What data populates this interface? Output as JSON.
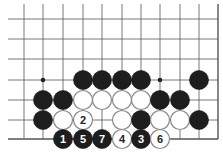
{
  "board": {
    "grid_x": [
      24,
      43,
      63,
      83,
      102,
      122,
      141,
      160,
      180,
      199,
      218
    ],
    "grid_y": [
      19,
      39,
      59,
      80,
      100,
      120,
      139
    ],
    "line_left": 8,
    "line_top": 4,
    "right_edge_col": 10,
    "bottom_edge_row": 6,
    "line_color": "#555555",
    "stone_radius": 9.5,
    "colors": {
      "black": "#1e1e1e",
      "white": "#ffffff",
      "white_border": "#888888"
    },
    "star_points": [
      {
        "col": 1,
        "row": 3
      },
      {
        "col": 7,
        "row": 3
      }
    ],
    "stones": [
      {
        "col": 3,
        "row": 3,
        "color": "black",
        "label": ""
      },
      {
        "col": 4,
        "row": 3,
        "color": "black",
        "label": ""
      },
      {
        "col": 5,
        "row": 3,
        "color": "black",
        "label": ""
      },
      {
        "col": 6,
        "row": 3,
        "color": "black",
        "label": ""
      },
      {
        "col": 9,
        "row": 3,
        "color": "black",
        "label": ""
      },
      {
        "col": 1,
        "row": 4,
        "color": "black",
        "label": ""
      },
      {
        "col": 2,
        "row": 4,
        "color": "black",
        "label": ""
      },
      {
        "col": 3,
        "row": 4,
        "color": "white",
        "label": ""
      },
      {
        "col": 4,
        "row": 4,
        "color": "white",
        "label": ""
      },
      {
        "col": 5,
        "row": 4,
        "color": "white",
        "label": ""
      },
      {
        "col": 6,
        "row": 4,
        "color": "white",
        "label": ""
      },
      {
        "col": 7,
        "row": 4,
        "color": "black",
        "label": ""
      },
      {
        "col": 8,
        "row": 4,
        "color": "black",
        "label": ""
      },
      {
        "col": 1,
        "row": 5,
        "color": "black",
        "label": ""
      },
      {
        "col": 2,
        "row": 5,
        "color": "white",
        "label": ""
      },
      {
        "col": 3,
        "row": 5,
        "color": "white",
        "label": "2"
      },
      {
        "col": 5,
        "row": 5,
        "color": "white",
        "label": ""
      },
      {
        "col": 6,
        "row": 5,
        "color": "black",
        "label": ""
      },
      {
        "col": 7,
        "row": 5,
        "color": "white",
        "label": ""
      },
      {
        "col": 8,
        "row": 5,
        "color": "white",
        "label": ""
      },
      {
        "col": 9,
        "row": 5,
        "color": "black",
        "label": ""
      },
      {
        "col": 2,
        "row": 6,
        "color": "black",
        "label": "1"
      },
      {
        "col": 3,
        "row": 6,
        "color": "black",
        "label": "5"
      },
      {
        "col": 4,
        "row": 6,
        "color": "black",
        "label": "7"
      },
      {
        "col": 5,
        "row": 6,
        "color": "white",
        "label": "4"
      },
      {
        "col": 6,
        "row": 6,
        "color": "black",
        "label": "3"
      },
      {
        "col": 7,
        "row": 6,
        "color": "white",
        "label": "6"
      }
    ]
  }
}
